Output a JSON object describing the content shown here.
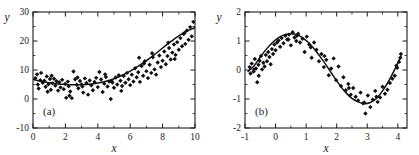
{
  "figure": {
    "background": "#ffffff",
    "marker_color": "#101010",
    "curve_color": "#121212",
    "axis_color": "#1a1a1a"
  },
  "chart_data": [
    {
      "type": "scatter",
      "panel": "(a)",
      "title": "",
      "xlabel": "x",
      "ylabel": "y",
      "xlim": [
        0,
        10
      ],
      "ylim": [
        -10,
        30
      ],
      "xticks": [
        0,
        2,
        4,
        6,
        8,
        10
      ],
      "xtick_labels": [
        "0",
        "2",
        "4",
        "6",
        "8",
        "10"
      ],
      "yticks": [
        -10,
        0,
        10,
        20,
        30
      ],
      "ytick_labels": [
        "-10",
        "0",
        "10",
        "20",
        "30"
      ],
      "xminor_step": 1,
      "yminor_step": 5,
      "grid": false,
      "legend": "none",
      "series": [
        {
          "name": "data",
          "kind": "scatter",
          "marker": "diamond",
          "x": [
            0.15,
            0.25,
            0.35,
            0.45,
            0.5,
            0.6,
            0.7,
            0.78,
            0.85,
            0.95,
            1.05,
            1.1,
            1.2,
            1.3,
            1.38,
            1.45,
            1.55,
            1.62,
            1.7,
            1.8,
            1.9,
            1.98,
            2.05,
            2.15,
            2.2,
            2.3,
            2.4,
            2.5,
            2.6,
            2.7,
            2.8,
            2.9,
            3.0,
            3.1,
            3.2,
            3.3,
            3.4,
            3.5,
            3.6,
            3.7,
            3.8,
            3.9,
            4.0,
            4.1,
            4.2,
            4.3,
            4.4,
            4.5,
            4.6,
            4.7,
            4.8,
            4.9,
            5.0,
            5.1,
            5.2,
            5.3,
            5.4,
            5.5,
            5.6,
            5.7,
            5.8,
            5.9,
            6.0,
            6.1,
            6.2,
            6.3,
            6.4,
            6.5,
            6.6,
            6.7,
            6.8,
            6.9,
            7.0,
            7.1,
            7.2,
            7.3,
            7.4,
            7.5,
            7.6,
            7.7,
            7.8,
            7.9,
            8.0,
            8.1,
            8.2,
            8.3,
            8.4,
            8.5,
            8.6,
            8.7,
            8.8,
            8.9,
            9.0,
            9.1,
            9.2,
            9.3,
            9.4,
            9.5,
            9.6,
            9.7,
            9.8,
            9.9,
            0.3,
            1.15,
            2.25,
            3.05,
            4.45,
            5.45,
            6.55,
            7.35,
            8.35,
            9.35,
            0.9,
            2.75,
            4.85,
            6.85,
            8.75
          ],
          "y": [
            7.2,
            8.5,
            3.6,
            6.5,
            9.0,
            5.6,
            6.3,
            4.2,
            7.8,
            5.1,
            6.9,
            3.2,
            5.4,
            7.0,
            4.6,
            6.1,
            2.9,
            5.8,
            4.0,
            6.6,
            3.4,
            5.2,
            0.4,
            6.0,
            4.4,
            2.6,
            0.3,
            9.5,
            6.8,
            4.9,
            3.7,
            6.2,
            5.0,
            2.2,
            7.1,
            5.5,
            1.5,
            6.4,
            4.7,
            3.0,
            5.9,
            7.3,
            4.1,
            9.3,
            6.7,
            2.4,
            5.3,
            7.6,
            4.3,
            6.0,
            0.0,
            5.7,
            3.9,
            7.4,
            5.0,
            8.2,
            6.3,
            4.5,
            7.9,
            5.6,
            9.0,
            6.8,
            4.8,
            8.4,
            6.0,
            10.6,
            7.5,
            9.2,
            5.9,
            11.4,
            8.0,
            13.0,
            9.6,
            7.2,
            11.8,
            9.0,
            14.4,
            10.2,
            8.4,
            12.6,
            15.0,
            11.0,
            13.2,
            16.4,
            12.0,
            14.8,
            17.6,
            13.6,
            16.0,
            18.8,
            15.2,
            19.6,
            17.0,
            21.0,
            18.2,
            22.4,
            19.0,
            23.6,
            20.4,
            24.8,
            21.6,
            26.6,
            5.0,
            8.0,
            1.1,
            4.3,
            8.5,
            2.8,
            14.2,
            15.8,
            19.4,
            22.8,
            2.5,
            7.4,
            6.2,
            12.2,
            13.8,
            6.1,
            4.2,
            5.0,
            9.1,
            11.0
          ]
        },
        {
          "name": "fit",
          "kind": "line",
          "label": "quadratic fit",
          "x": [
            0.0,
            0.5,
            1.0,
            1.5,
            2.0,
            2.5,
            3.0,
            3.5,
            4.0,
            4.5,
            5.0,
            5.5,
            6.0,
            6.5,
            7.0,
            7.5,
            8.0,
            8.5,
            9.0,
            9.5,
            10.0
          ],
          "y": [
            6.8,
            6.1,
            5.6,
            5.2,
            5.0,
            4.9,
            4.9,
            5.1,
            5.5,
            6.1,
            7.0,
            8.2,
            9.6,
            11.3,
            13.2,
            15.3,
            17.6,
            19.8,
            21.8,
            23.4,
            24.6
          ]
        }
      ]
    },
    {
      "type": "scatter",
      "panel": "(b)",
      "title": "",
      "xlabel": "x",
      "ylabel": "y",
      "xlim": [
        -1,
        4.3
      ],
      "ylim": [
        -2,
        2
      ],
      "xticks": [
        -1,
        0,
        1,
        2,
        3,
        4
      ],
      "xtick_labels": [
        "-1",
        "0",
        "1",
        "2",
        "3",
        "4"
      ],
      "yticks": [
        -2,
        -1,
        0,
        1,
        2
      ],
      "ytick_labels": [
        "-2",
        "-1",
        "0",
        "1",
        "2"
      ],
      "xminor_step": 0.5,
      "yminor_step": 0.5,
      "grid": false,
      "legend": "none",
      "series": [
        {
          "name": "data",
          "kind": "scatter",
          "marker": "diamond",
          "x": [
            -0.85,
            -0.82,
            -0.78,
            -0.72,
            -0.68,
            -0.64,
            -0.6,
            -0.56,
            -0.52,
            -0.48,
            -0.44,
            -0.4,
            -0.36,
            -0.32,
            -0.28,
            -0.24,
            -0.2,
            -0.16,
            -0.12,
            -0.08,
            -0.04,
            0.0,
            0.05,
            0.1,
            0.15,
            0.2,
            0.26,
            0.32,
            0.38,
            0.44,
            0.5,
            0.56,
            0.62,
            0.68,
            0.74,
            0.8,
            0.88,
            0.95,
            1.02,
            1.1,
            1.18,
            1.26,
            1.34,
            1.42,
            1.5,
            1.58,
            1.66,
            1.74,
            1.82,
            1.9,
            1.98,
            2.06,
            2.14,
            2.22,
            2.3,
            2.38,
            2.46,
            2.54,
            2.62,
            2.7,
            2.78,
            2.86,
            2.94,
            3.02,
            3.1,
            3.18,
            3.26,
            3.34,
            3.42,
            3.5,
            3.58,
            3.66,
            3.74,
            3.82,
            3.9,
            3.98,
            4.04,
            4.08,
            4.1,
            -0.7,
            -0.55,
            0.42,
            0.7,
            1.15,
            1.6,
            2.4,
            2.9,
            3.3,
            3.95
          ],
          "y": [
            0.1,
            -0.12,
            0.22,
            -0.05,
            0.38,
            0.05,
            -0.42,
            0.18,
            0.32,
            0.48,
            0.02,
            0.25,
            0.12,
            0.52,
            0.3,
            0.62,
            0.45,
            0.2,
            0.72,
            0.55,
            0.88,
            0.68,
            0.95,
            1.02,
            0.8,
            1.1,
            0.92,
            1.18,
            1.05,
            1.22,
            0.85,
            1.3,
            1.12,
            1.0,
            1.25,
            0.95,
            1.08,
            0.62,
            1.15,
            0.88,
            0.42,
            0.95,
            0.7,
            0.3,
            0.55,
            0.1,
            0.35,
            -0.18,
            0.05,
            0.4,
            -0.35,
            0.12,
            -0.55,
            -0.25,
            -0.7,
            -0.48,
            -0.85,
            -0.62,
            -0.92,
            -1.05,
            -0.78,
            -1.15,
            -1.5,
            -0.88,
            -1.28,
            -1.02,
            -0.72,
            -1.1,
            -0.95,
            -0.58,
            -0.82,
            -0.68,
            -0.45,
            -0.3,
            -0.2,
            0.08,
            0.28,
            0.42,
            0.55,
            0.02,
            -0.2,
            1.05,
            1.18,
            0.78,
            0.48,
            -0.62,
            -1.12,
            -0.92,
            0.15
          ]
        },
        {
          "name": "fit",
          "kind": "line",
          "label": "sinusoidal fit",
          "x": [
            -0.9,
            -0.7,
            -0.5,
            -0.3,
            -0.1,
            0.1,
            0.3,
            0.5,
            0.7,
            0.9,
            1.1,
            1.3,
            1.5,
            1.7,
            1.9,
            2.1,
            2.3,
            2.5,
            2.7,
            2.9,
            3.1,
            3.3,
            3.5,
            3.7,
            3.9,
            4.1
          ],
          "y": [
            -0.05,
            0.15,
            0.45,
            0.72,
            0.95,
            1.12,
            1.22,
            1.25,
            1.22,
            1.1,
            0.92,
            0.68,
            0.4,
            0.1,
            -0.22,
            -0.52,
            -0.78,
            -0.98,
            -1.1,
            -1.16,
            -1.12,
            -0.98,
            -0.72,
            -0.38,
            0.02,
            0.48
          ]
        }
      ]
    }
  ]
}
